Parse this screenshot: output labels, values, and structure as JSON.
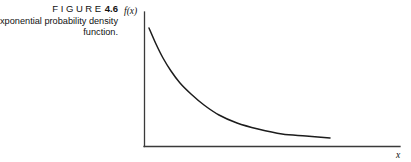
{
  "figure": {
    "label_word": "FIGURE",
    "label_number": "4.6",
    "caption_line_1": "xponential probability density",
    "caption_line_2": "function."
  },
  "plot": {
    "y_axis_label": "f(x)",
    "x_axis_label": "x",
    "colors": {
      "axis": "#3a3a3a",
      "curve": "#1c1c1c",
      "background": "#ffffff",
      "text": "#111111"
    }
  },
  "chart_data": {
    "type": "line",
    "xlabel": "x",
    "ylabel": "f(x)",
    "grid": false,
    "legend": "none",
    "axis_origin_px": [
      144,
      146
    ],
    "axis_x_end_px": [
      400,
      146
    ],
    "axis_y_top_px": [
      144,
      12
    ],
    "curve_description": "Monotonically decreasing exponential decay curve starting high near the y-axis and flattening asymptotically toward the x-axis",
    "x": [
      0.0,
      0.1,
      0.2,
      0.3,
      0.4,
      0.5,
      0.6,
      0.7,
      0.8,
      0.9,
      1.0
    ],
    "y": [
      1.0,
      0.66,
      0.45,
      0.31,
      0.22,
      0.16,
      0.12,
      0.095,
      0.075,
      0.062,
      0.055
    ],
    "curve_points_px": [
      [
        149,
        28
      ],
      [
        156,
        44
      ],
      [
        163,
        58
      ],
      [
        171,
        71
      ],
      [
        180,
        83
      ],
      [
        191,
        94
      ],
      [
        204,
        105
      ],
      [
        219,
        115
      ],
      [
        237,
        123
      ],
      [
        258,
        129
      ],
      [
        282,
        134
      ],
      [
        306,
        136
      ],
      [
        330,
        138
      ]
    ]
  }
}
